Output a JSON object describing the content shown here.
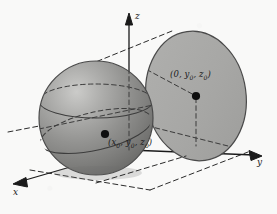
{
  "figure": {
    "kind": "3d-geometry-diagram",
    "background_color": "#f9f9f8",
    "ink_color": "#1a1a1a",
    "axes": {
      "z": {
        "label": "z",
        "direction": "up",
        "arrowhead": true
      },
      "y": {
        "label": "y",
        "direction": "right",
        "arrowhead": true
      },
      "x": {
        "label": "x",
        "direction": "down-left",
        "arrowhead": true
      }
    },
    "sphere": {
      "name": "shaded-sphere",
      "fill_color": "#8e8e8e",
      "highlight_color": "#c9c9c7",
      "shadow_color": "#6b6b6b",
      "outline_color": "#4a4a4a",
      "center_label": "(x₀, y₀, z₀)",
      "center_label_parts": {
        "open": "(",
        "x": "x",
        "sub_x": "0",
        "y": "y",
        "sub_y": "0",
        "z": "z",
        "sub_z": "0",
        "close": ")"
      },
      "center_dot": true
    },
    "plane": {
      "name": "tangent-plane-disk",
      "fill_color": "#a9a9a7",
      "outline_color": "#4a4a4a",
      "center_label": "(0, y₀, z₀)",
      "center_label_parts": {
        "open": "(",
        "x": "0",
        "y": "y",
        "sub_y": "0",
        "z": "z",
        "sub_z": "0",
        "close": ")"
      },
      "center_dot": true
    },
    "construction_lines": {
      "style": "dashed",
      "color": "#2b2b2b",
      "count": 6
    },
    "labels": {
      "z_axis": "z",
      "y_axis": "y",
      "x_axis": "x",
      "sphere_center": "(x₀, y₀, z₀)",
      "plane_center": "(0, y₀, z₀)"
    }
  }
}
